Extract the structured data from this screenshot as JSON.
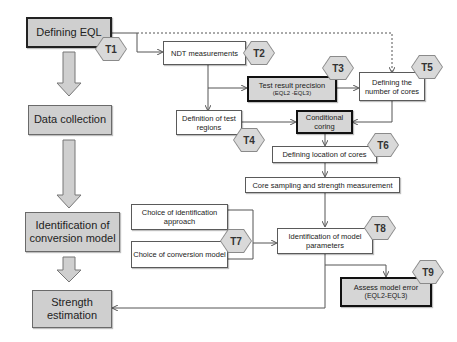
{
  "diagram": {
    "main_flow": [
      {
        "id": "defining-eql",
        "label": "Defining EQL"
      },
      {
        "id": "data-collection",
        "label": "Data collection"
      },
      {
        "id": "identification-conversion-model",
        "label": "Identification of conversion model"
      },
      {
        "id": "strength-estimation",
        "label": "Strength estimation"
      }
    ],
    "tasks": {
      "ndt": {
        "label": "NDT measurements",
        "tag": "T2"
      },
      "precision": {
        "label": "Test result precision",
        "sub": "(EQL2 -EQL3)",
        "tag": "T3"
      },
      "num_cores": {
        "label": "Defining the number of cores",
        "tag": "T5"
      },
      "test_regions": {
        "label": "Definition of test regions",
        "tag": "T4"
      },
      "conditional": {
        "label": "Conditional coring"
      },
      "location": {
        "label": "Defining location of cores",
        "tag": "T6"
      },
      "core_sampling": {
        "label": "Core sampling and strength measurement"
      },
      "choice_approach": {
        "label": "Choice of identification approach"
      },
      "choice_model": {
        "label": "Choice of conversion model",
        "tag": "T7"
      },
      "model_params": {
        "label": "Identification of model parameters",
        "tag": "T8"
      },
      "model_error": {
        "label": "Assess model error",
        "sub": "(EQL2-EQL3)",
        "tag": "T9"
      }
    },
    "t1_tag": "T1",
    "colors": {
      "gray_fill": "#d6d6d6",
      "hex_fill": "#d9d9d9",
      "line": "#555555",
      "bold_border": "#111111"
    }
  }
}
